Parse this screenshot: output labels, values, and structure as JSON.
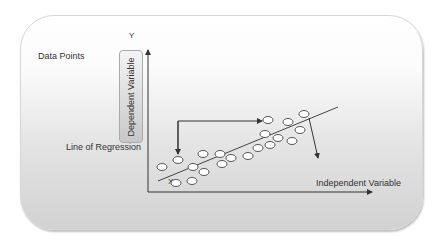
{
  "labels": {
    "data_points": "Data Points",
    "y_axis": "Y",
    "x_point": "X",
    "dependent_variable": "Dependent Variable",
    "line_of_regression": "Line of Regression",
    "independent_variable": "Independent Variable"
  },
  "colors": {
    "axis": "#333333",
    "point_fill": "#ffffff",
    "point_stroke": "#555555",
    "text": "#333333"
  },
  "chart_data": {
    "type": "scatter",
    "title": "",
    "xlabel": "Independent Variable",
    "ylabel": "Dependent Variable",
    "annotations": [
      "Data Points",
      "Line of Regression",
      "Y",
      "X"
    ],
    "points_px": [
      [
        162,
        167
      ],
      [
        178,
        160
      ],
      [
        193,
        167
      ],
      [
        176,
        183
      ],
      [
        192,
        181
      ],
      [
        203,
        154
      ],
      [
        204,
        172
      ],
      [
        220,
        154
      ],
      [
        222,
        164
      ],
      [
        231,
        158
      ],
      [
        248,
        156
      ],
      [
        258,
        148
      ],
      [
        265,
        134
      ],
      [
        270,
        145
      ],
      [
        278,
        138
      ],
      [
        288,
        122
      ],
      [
        292,
        141
      ],
      [
        300,
        130
      ],
      [
        304,
        114
      ],
      [
        268,
        120
      ]
    ],
    "regression_line_px": [
      [
        158,
        181
      ],
      [
        338,
        107
      ]
    ],
    "grid": false,
    "legend": "none"
  }
}
